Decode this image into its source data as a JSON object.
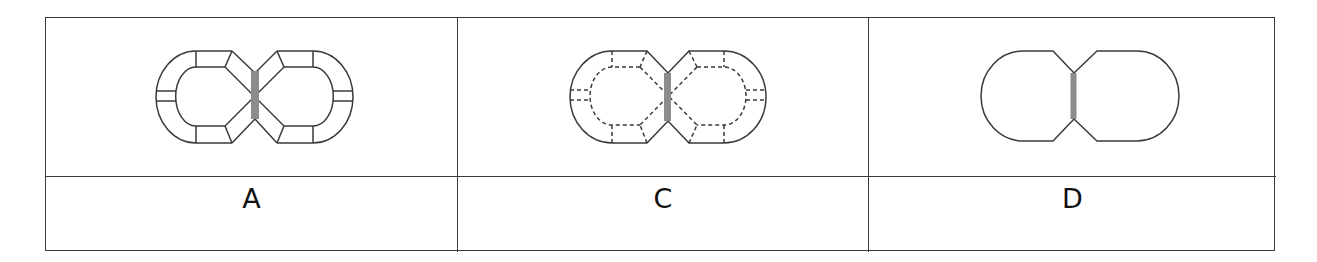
{
  "table": {
    "rows": 2,
    "columns": 3,
    "panels": [
      {
        "label": "A",
        "figure": "figure-eight track with solid segment ties and gray crossing bar"
      },
      {
        "label": "C",
        "figure": "figure-eight track with dashed inner line and dashed ties and gray crossing bar"
      },
      {
        "label": "D",
        "figure": "figure-eight outline only with gray crossing bar"
      }
    ]
  },
  "colors": {
    "line": "#3a3a3a",
    "bar": "#8c8c8c",
    "background": "#ffffff"
  }
}
